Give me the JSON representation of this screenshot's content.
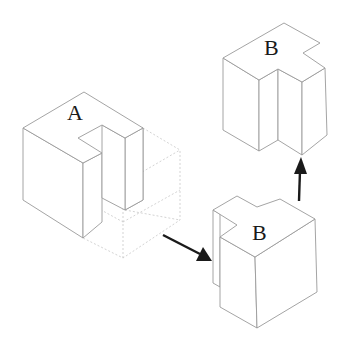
{
  "diagram": {
    "type": "isometric-block-transformation",
    "blocks": [
      {
        "id": "A",
        "label": "A",
        "description": "L-shaped isometric block with notch, shown with dotted ghost cube"
      },
      {
        "id": "B-bottom",
        "label": "B",
        "description": "Block B intermediate position (lower right)"
      },
      {
        "id": "B-top",
        "label": "B",
        "description": "Block B final position (upper right)"
      }
    ],
    "arrows": [
      {
        "from": "A",
        "to": "B-bottom",
        "direction": "down-right"
      },
      {
        "from": "B-bottom",
        "to": "B-top",
        "direction": "up"
      }
    ],
    "colors": {
      "edge": "#9a9a9a",
      "dotted": "#c8c8c8",
      "arrow": "#1a1a1a",
      "label": "#1a1a1a",
      "background": "#ffffff"
    }
  }
}
